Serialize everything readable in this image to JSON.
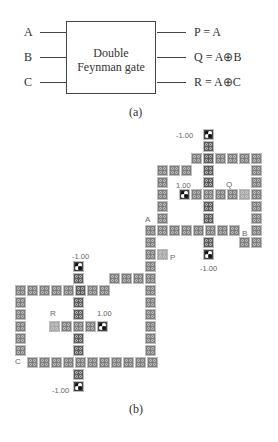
{
  "panel_a": {
    "inputs": [
      "A",
      "B",
      "C"
    ],
    "gate_title_line1": "Double",
    "gate_title_line2": "Feynman gate",
    "outputs": [
      "P = A",
      "Q = A⊕B",
      "R = A⊕C"
    ],
    "caption": "(a)"
  },
  "panel_b": {
    "caption": "(b)",
    "labels": {
      "A": "A",
      "B": "B",
      "C": "C",
      "P": "P",
      "Q": "Q",
      "R": "R"
    },
    "polarizations": {
      "top_fixed": "-1.00",
      "top_inner_fixed": "1.00",
      "mid_fixed": "-1.00",
      "left_top_fixed": "-1.00",
      "left_inner_fixed": "1.00",
      "bottom_fixed": "-1.00"
    }
  }
}
